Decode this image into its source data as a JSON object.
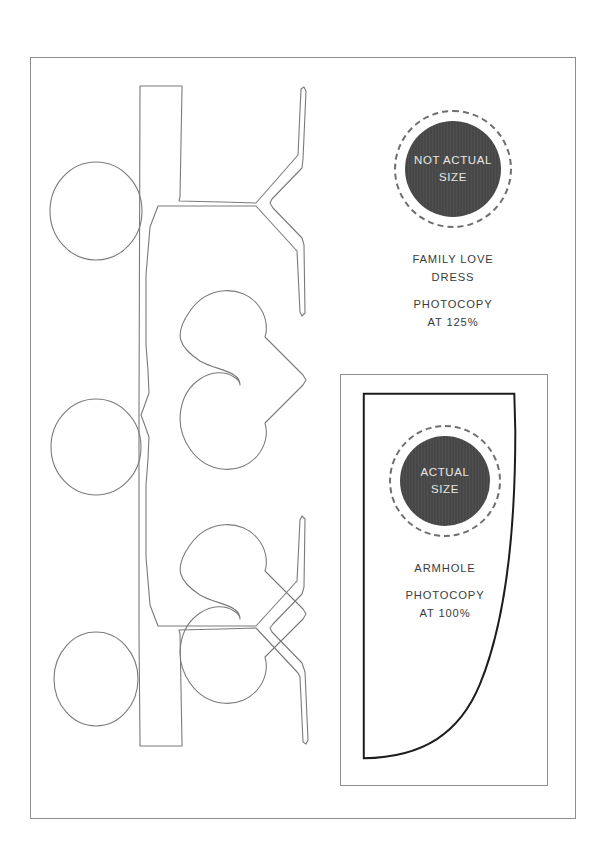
{
  "page": {
    "background_color": "#ffffff",
    "sheet_border_color": "#8d8d8d"
  },
  "left_pattern": {
    "name": "paper-doll-chain-pattern",
    "description": "Folded paper-doll chain outline with three round heads and two heart bodies",
    "line_color": "#7a7a7a"
  },
  "stamps": [
    {
      "id": "not-actual-size",
      "line1": "NOT ACTUAL",
      "line2": "SIZE",
      "disc_color": "#474747",
      "text_color": "#e8e8e8",
      "ring_color": "#6e6e6e"
    },
    {
      "id": "actual-size",
      "line1": "ACTUAL",
      "line2": "SIZE",
      "disc_color": "#474747",
      "text_color": "#e8e8e8",
      "ring_color": "#6e6e6e"
    }
  ],
  "captions": {
    "dress": {
      "title_line1": "FAMILY LOVE",
      "title_line2": "DRESS",
      "instruction_line1": "PHOTOCOPY",
      "instruction_line2": "AT 125%"
    },
    "armhole": {
      "title_line1": "ARMHOLE",
      "instruction_line1": "PHOTOCOPY",
      "instruction_line2": "AT 100%"
    }
  },
  "armhole_box": {
    "name": "armhole-template-frame",
    "outline_color": "#1c1c1c",
    "frame_color": "#8d8d8d"
  }
}
